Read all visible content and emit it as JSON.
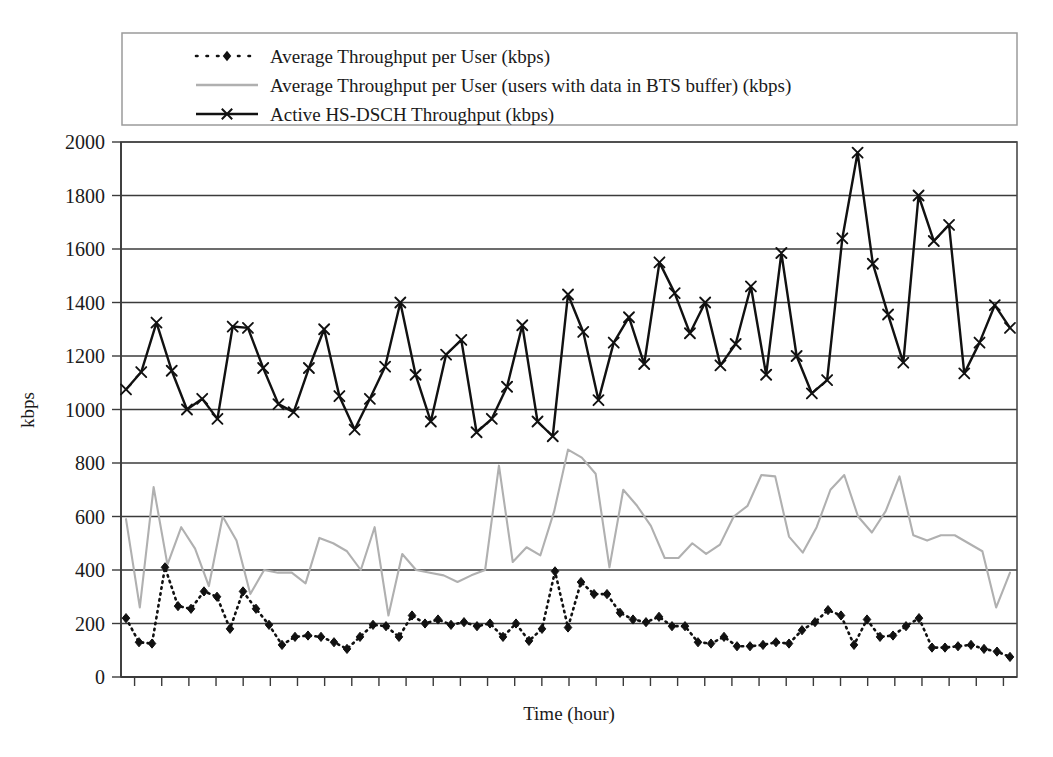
{
  "chart_data": {
    "type": "line",
    "title": "",
    "xlabel": "Time (hour)",
    "ylabel": "kbps",
    "ylim": [
      0,
      2000
    ],
    "yticks": [
      0,
      200,
      400,
      600,
      800,
      1000,
      1200,
      1400,
      1600,
      1800,
      2000
    ],
    "ytick_labels": [
      "0",
      "200",
      "400",
      "600",
      "800",
      "1000",
      "1200",
      "1400",
      "1600",
      "1800",
      "2000"
    ],
    "grid": true,
    "grid_axis": "y",
    "xtick_labels": [],
    "xtick_count": 33,
    "legend_position": "top",
    "legend_border": true,
    "series": [
      {
        "name": "Average Throughput per User (kbps)",
        "marker": "diamond",
        "linestyle": "dotted",
        "color": "#111111",
        "values": [
          220,
          130,
          125,
          410,
          265,
          255,
          320,
          300,
          180,
          320,
          255,
          195,
          120,
          150,
          155,
          150,
          130,
          105,
          150,
          195,
          190,
          150,
          230,
          200,
          215,
          195,
          205,
          190,
          200,
          150,
          200,
          135,
          180,
          395,
          185,
          355,
          310,
          310,
          240,
          215,
          205,
          225,
          190,
          190,
          130,
          125,
          150,
          115,
          115,
          120,
          130,
          125,
          175,
          205,
          250,
          230,
          120,
          215,
          150,
          155,
          190,
          220,
          110,
          110,
          115,
          120,
          105,
          95,
          75
        ]
      },
      {
        "name": "Average Throughput per User (users with data in BTS buffer) (kbps)",
        "marker": "none",
        "linestyle": "solid",
        "color": "#b0b0b0",
        "values": [
          590,
          260,
          710,
          420,
          560,
          480,
          340,
          600,
          510,
          310,
          400,
          390,
          390,
          350,
          520,
          500,
          470,
          400,
          560,
          230,
          460,
          400,
          390,
          380,
          355,
          380,
          400,
          790,
          430,
          485,
          455,
          620,
          850,
          820,
          760,
          410,
          700,
          640,
          565,
          445,
          445,
          500,
          460,
          495,
          600,
          640,
          755,
          750,
          525,
          465,
          560,
          700,
          755,
          600,
          540,
          620,
          750,
          530,
          510,
          530,
          530,
          500,
          470,
          260,
          390
        ]
      },
      {
        "name": "Active HS-DSCH Throughput (kbps)",
        "marker": "x",
        "linestyle": "solid",
        "color": "#111111",
        "values": [
          1075,
          1140,
          1325,
          1145,
          1000,
          1040,
          965,
          1310,
          1305,
          1155,
          1020,
          990,
          1155,
          1300,
          1050,
          925,
          1040,
          1160,
          1400,
          1130,
          955,
          1205,
          1260,
          915,
          965,
          1085,
          1315,
          955,
          900,
          1430,
          1290,
          1035,
          1250,
          1345,
          1170,
          1550,
          1435,
          1285,
          1400,
          1165,
          1245,
          1460,
          1130,
          1585,
          1200,
          1060,
          1110,
          1640,
          1960,
          1545,
          1355,
          1175,
          1800,
          1630,
          1690,
          1135,
          1250,
          1390,
          1305
        ]
      }
    ]
  },
  "legend": {
    "items": [
      {
        "label": "Average Throughput per User (kbps)",
        "marker": "dotted-diamond"
      },
      {
        "label": "Average Throughput per User (users with data in BTS buffer) (kbps)",
        "marker": "solid-gray-line"
      },
      {
        "label": "Active HS-DSCH Throughput (kbps)",
        "marker": "solid-black-line-x"
      }
    ]
  },
  "axes": {
    "y_title": "kbps",
    "x_title": "Time (hour)",
    "y_labels": [
      "2000",
      "1800",
      "1600",
      "1400",
      "1200",
      "1000",
      "800",
      "600",
      "400",
      "200",
      "0"
    ]
  },
  "colors": {
    "series_black": "#111111",
    "series_gray": "#b0b0b0",
    "grid": "#3b3b3b",
    "frame": "#4a4a4a",
    "legend_border": "#9b9b9b",
    "background": "#ffffff"
  }
}
